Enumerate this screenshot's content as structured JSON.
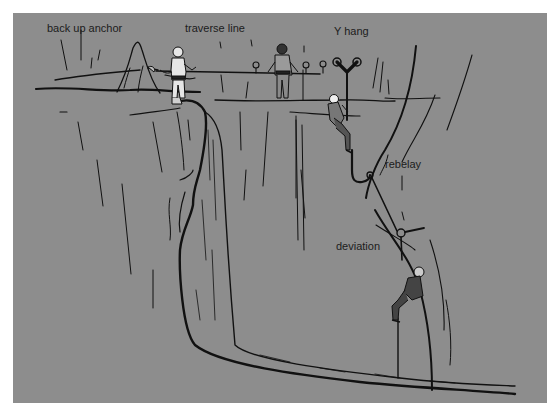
{
  "figure": {
    "background_color": "#8d8d8d",
    "ink_color": "#111111",
    "labels": {
      "back_up_anchor": "back up anchor",
      "traverse_line": "traverse line",
      "y_hang": "Y hang",
      "rebelay": "rebelay",
      "deviation": "deviation"
    }
  }
}
